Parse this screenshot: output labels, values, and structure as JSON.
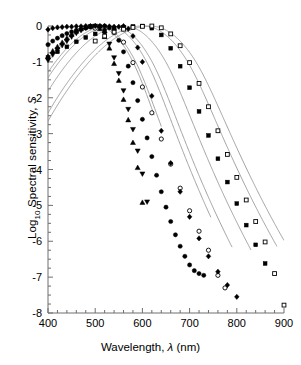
{
  "chart_data": {
    "type": "scatter",
    "title": "",
    "xlabel": "Wavelength, λ (nm)",
    "ylabel": "Log10 Spectral sensitivity, S",
    "xlim": [
      400,
      900
    ],
    "ylim": [
      -8,
      0
    ],
    "xticks": [
      400,
      500,
      600,
      700,
      800,
      900
    ],
    "yticks": [
      0,
      -1,
      -2,
      -3,
      -4,
      -5,
      -6,
      -7,
      -8
    ],
    "xminor_step": 20,
    "yminor_step": 0.25,
    "grid": false,
    "legend": "none",
    "axis_line_color": "#6e6e6e",
    "curve_color": "#8a8a8a",
    "marker_color": "#000000",
    "series": [
      {
        "name": "up-triangle",
        "marker": "triangle-up",
        "fill": "solid",
        "lambda_max": 500,
        "x": [
          400,
          410,
          420,
          430,
          440,
          450,
          460,
          470,
          480,
          490,
          500,
          510,
          520,
          530,
          540,
          550,
          560,
          570,
          580,
          590,
          600
        ],
        "y": [
          -0.85,
          -0.7,
          -0.58,
          -0.46,
          -0.34,
          -0.24,
          -0.15,
          -0.08,
          -0.03,
          -0.01,
          0.0,
          -0.08,
          -0.3,
          -0.62,
          -1.05,
          -1.52,
          -2.05,
          -2.62,
          -3.25,
          -3.95,
          -4.92
        ]
      },
      {
        "name": "down-triangle",
        "marker": "triangle-down",
        "fill": "solid",
        "lambda_max": 505,
        "x": [
          400,
          410,
          420,
          430,
          440,
          450,
          460,
          470,
          480,
          490,
          500,
          510,
          520,
          530,
          540,
          550,
          560,
          570,
          580,
          590,
          600,
          610
        ],
        "y": [
          -0.95,
          -0.8,
          -0.66,
          -0.54,
          -0.42,
          -0.3,
          -0.2,
          -0.12,
          -0.05,
          -0.01,
          0.0,
          -0.05,
          -0.22,
          -0.5,
          -0.88,
          -1.32,
          -1.8,
          -2.32,
          -2.88,
          -3.48,
          -4.12,
          -4.9
        ]
      },
      {
        "name": "filled-circle",
        "marker": "circle",
        "fill": "solid",
        "lambda_max": 525,
        "x": [
          400,
          410,
          420,
          430,
          440,
          450,
          460,
          470,
          480,
          490,
          500,
          510,
          520,
          530,
          540,
          550,
          560,
          570,
          580,
          590,
          600,
          610,
          620,
          630,
          640,
          650,
          660,
          670,
          680,
          690,
          700,
          710,
          720,
          730
        ],
        "y": [
          -0.52,
          -0.42,
          -0.34,
          -0.27,
          -0.21,
          -0.16,
          -0.12,
          -0.09,
          -0.06,
          -0.03,
          -0.01,
          0.0,
          0.0,
          -0.05,
          -0.18,
          -0.4,
          -0.72,
          -1.12,
          -1.58,
          -2.08,
          -2.6,
          -3.12,
          -3.64,
          -4.16,
          -4.62,
          -5.05,
          -5.45,
          -5.82,
          -6.14,
          -6.42,
          -6.66,
          -6.82,
          -6.9,
          -6.95
        ]
      },
      {
        "name": "open-circle",
        "marker": "circle",
        "fill": "open",
        "lambda_max": 535,
        "x": [
          500,
          520,
          540,
          560,
          580,
          600,
          620,
          640,
          660,
          680,
          700,
          720,
          740,
          760,
          775
        ],
        "y": [
          -0.06,
          -0.01,
          -0.1,
          -0.45,
          -1.02,
          -1.7,
          -2.42,
          -3.15,
          -3.85,
          -4.52,
          -5.15,
          -5.72,
          -6.25,
          -6.95,
          -7.3
        ]
      },
      {
        "name": "diamond",
        "marker": "diamond",
        "fill": "solid",
        "lambda_max": 560,
        "x": [
          400,
          410,
          420,
          430,
          440,
          450,
          460,
          470,
          480,
          490,
          500,
          510,
          520,
          530,
          540,
          550,
          560,
          570,
          580,
          590,
          600,
          620,
          640,
          660,
          680,
          700,
          720,
          740,
          760,
          780,
          800
        ],
        "y": [
          -0.1,
          -0.06,
          -0.04,
          -0.03,
          -0.02,
          -0.02,
          -0.01,
          -0.01,
          0.0,
          0.0,
          0.0,
          0.0,
          0.0,
          -0.01,
          -0.02,
          -0.02,
          0.0,
          -0.08,
          -0.28,
          -0.6,
          -1.0,
          -1.95,
          -2.92,
          -3.82,
          -4.62,
          -5.32,
          -5.92,
          -6.42,
          -6.85,
          -7.22,
          -7.55
        ]
      },
      {
        "name": "filled-square",
        "marker": "square",
        "fill": "solid",
        "lambda_max": 600,
        "x": [
          400,
          420,
          440,
          460,
          480,
          500,
          520,
          540,
          560,
          580,
          600,
          620,
          640,
          660,
          680,
          700,
          720,
          740,
          760,
          780,
          800,
          820,
          840,
          860
        ],
        "y": [
          -0.88,
          -0.72,
          -0.58,
          -0.44,
          -0.32,
          -0.22,
          -0.13,
          -0.07,
          -0.03,
          -0.01,
          0.0,
          -0.06,
          -0.25,
          -0.62,
          -1.12,
          -1.72,
          -2.38,
          -3.05,
          -3.7,
          -4.35,
          -4.95,
          -5.55,
          -6.1,
          -6.62
        ]
      },
      {
        "name": "open-square",
        "marker": "square",
        "fill": "open",
        "lambda_max": 615,
        "x": [
          500,
          520,
          540,
          560,
          580,
          600,
          620,
          640,
          660,
          680,
          700,
          720,
          740,
          760,
          780,
          800,
          820,
          840,
          860,
          880,
          900
        ],
        "y": [
          -0.42,
          -0.28,
          -0.17,
          -0.09,
          -0.04,
          -0.01,
          0.0,
          -0.05,
          -0.22,
          -0.55,
          -1.02,
          -1.6,
          -2.25,
          -2.92,
          -3.58,
          -4.22,
          -4.85,
          -5.45,
          -6.02,
          -6.9,
          -7.78
        ]
      }
    ],
    "curves": [
      {
        "name": "curve-up-triangle",
        "lambda_max": 500,
        "x_end": 625
      },
      {
        "name": "curve-down-triangle",
        "lambda_max": 505,
        "x_end": 640
      },
      {
        "name": "curve-filled-circle",
        "lambda_max": 525,
        "x_end": 745
      },
      {
        "name": "curve-open-circle",
        "lambda_max": 535,
        "x_end": 790
      },
      {
        "name": "curve-diamond",
        "lambda_max": 560,
        "x_end": 830
      },
      {
        "name": "curve-filled-square",
        "lambda_max": 600,
        "x_end": 885
      },
      {
        "name": "curve-open-square",
        "lambda_max": 615,
        "x_end": 900
      }
    ]
  },
  "axes": {
    "xlabel_prefix": "Wavelength, ",
    "xlabel_lambda": "λ",
    "xlabel_suffix": " (nm)",
    "ylabel_prefix": "Log",
    "ylabel_sub": "10",
    "ylabel_mid": " Spectral sensitivity, ",
    "ylabel_italic": "S"
  }
}
